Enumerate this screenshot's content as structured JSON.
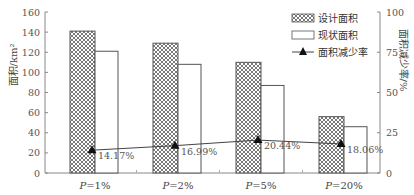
{
  "chart_data": {
    "type": "bar",
    "title": "",
    "categories": [
      "P=1%",
      "P=2%",
      "P=5%",
      "P=20%"
    ],
    "series": [
      {
        "name": "设计面积",
        "type": "bar",
        "axis": "left",
        "pattern": "crosshatch",
        "values": [
          141,
          129,
          110,
          56
        ]
      },
      {
        "name": "现状面积",
        "type": "bar",
        "axis": "left",
        "pattern": "none",
        "values": [
          121,
          108,
          87,
          46
        ]
      },
      {
        "name": "面积减少率",
        "type": "line",
        "axis": "right",
        "marker": "triangle",
        "values": [
          14.17,
          16.99,
          20.44,
          18.06
        ],
        "labels": [
          "14.17%",
          "16.99%",
          "20.44%",
          "18.06%"
        ]
      }
    ],
    "ylabel": "面积/km²",
    "y2label": "面积减少率/%",
    "ylim": [
      0,
      160
    ],
    "y2lim": [
      0,
      100
    ],
    "yticks": [
      0,
      20,
      40,
      60,
      80,
      100,
      120,
      140,
      160
    ],
    "y2ticks": [
      0,
      25,
      50,
      75,
      100
    ],
    "grid": false,
    "legend_position": "top-right"
  }
}
